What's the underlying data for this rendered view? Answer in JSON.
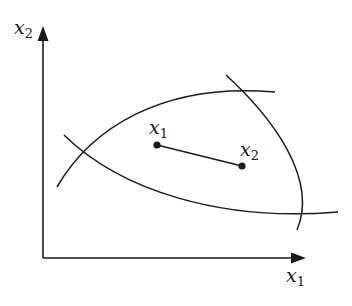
{
  "diagram": {
    "axes": {
      "x_label": {
        "var": "x",
        "sub": "1"
      },
      "y_label": {
        "var": "x",
        "sub": "2"
      }
    },
    "points": [
      {
        "id": "x1",
        "label": {
          "var": "x",
          "sub": "1"
        },
        "cx": 157,
        "cy": 145
      },
      {
        "id": "x2",
        "label": {
          "var": "x",
          "sub": "2"
        },
        "cx": 242,
        "cy": 166
      }
    ],
    "curves": [
      {
        "id": "upper-arc",
        "d": "M57,187 C90,130 160,82 275,92"
      },
      {
        "id": "lower-curve",
        "d": "M64,135 C120,190 220,222 338,212"
      },
      {
        "id": "right-curve",
        "d": "M226,75 C275,120 318,180 297,230"
      }
    ],
    "colors": {
      "ink": "#1a1a1a",
      "background": "#ffffff"
    }
  }
}
